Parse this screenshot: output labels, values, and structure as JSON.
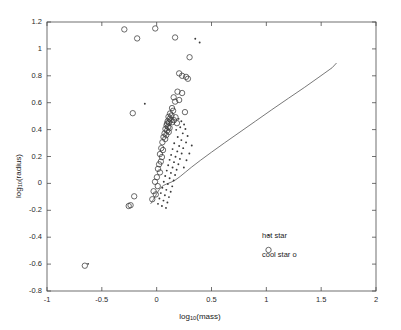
{
  "chart_data": {
    "type": "scatter",
    "title": "",
    "xlabel": "log10(mass)",
    "ylabel": "log10(radius)",
    "xlim": [
      -1,
      2
    ],
    "ylim": [
      -0.8,
      1.2
    ],
    "xticks": [
      "-1",
      "-0.5",
      "0",
      "0.5",
      "1",
      "1.5",
      "2"
    ],
    "xtickvals": [
      -1,
      -0.5,
      0,
      0.5,
      1,
      1.5,
      2
    ],
    "yticks": [
      "-0.8",
      "-0.6",
      "-0.4",
      "-0.2",
      "0",
      "0.2",
      "0.4",
      "0.6",
      "0.8",
      "1",
      "1.2"
    ],
    "ytickvals": [
      -0.8,
      -0.6,
      -0.4,
      -0.2,
      0,
      0.2,
      0.4,
      0.6,
      0.8,
      1.0,
      1.2
    ],
    "grid": false,
    "legend_position": "inside-lower-right",
    "marker_color": "#3a3a3a",
    "line_color": "#555555",
    "series": [
      {
        "name": "cool star",
        "marker": "o",
        "points": [
          [
            -0.655,
            -0.612
          ],
          [
            -0.255,
            -0.168
          ],
          [
            -0.238,
            -0.162
          ],
          [
            -0.205,
            -0.096
          ],
          [
            -0.218,
            0.522
          ],
          [
            -0.295,
            1.145
          ],
          [
            -0.178,
            1.078
          ],
          [
            -0.013,
            1.152
          ],
          [
            0.168,
            1.085
          ],
          [
            0.3,
            0.938
          ],
          [
            0.232,
            0.8
          ],
          [
            0.268,
            0.792
          ],
          [
            0.285,
            0.778
          ],
          [
            0.205,
            0.818
          ],
          [
            0.19,
            0.682
          ],
          [
            0.232,
            0.672
          ],
          [
            0.155,
            0.64
          ],
          [
            0.168,
            0.608
          ],
          [
            0.205,
            0.62
          ],
          [
            0.258,
            0.53
          ],
          [
            0.14,
            0.56
          ],
          [
            0.15,
            0.54
          ],
          [
            0.122,
            0.52
          ],
          [
            0.135,
            0.505
          ],
          [
            0.108,
            0.495
          ],
          [
            0.118,
            0.48
          ],
          [
            0.128,
            0.47
          ],
          [
            0.1,
            0.462
          ],
          [
            0.112,
            0.452
          ],
          [
            0.095,
            0.445
          ],
          [
            0.142,
            0.455
          ],
          [
            0.158,
            0.47
          ],
          [
            0.172,
            0.492
          ],
          [
            0.185,
            0.448
          ],
          [
            0.09,
            0.432
          ],
          [
            0.105,
            0.42
          ],
          [
            0.118,
            0.412
          ],
          [
            0.08,
            0.405
          ],
          [
            0.095,
            0.392
          ],
          [
            0.11,
            0.382
          ],
          [
            0.072,
            0.372
          ],
          [
            0.088,
            0.36
          ],
          [
            0.062,
            0.345
          ],
          [
            0.078,
            0.33
          ],
          [
            0.052,
            0.306
          ],
          [
            0.042,
            0.262
          ],
          [
            0.03,
            0.218
          ],
          [
            0.048,
            0.196
          ],
          [
            0.022,
            0.142
          ],
          [
            0.012,
            0.108
          ],
          [
            0.03,
            0.082
          ],
          [
            0.002,
            0.046
          ],
          [
            -0.015,
            0.012
          ],
          [
            0.01,
            -0.02
          ],
          [
            -0.028,
            -0.058
          ],
          [
            -0.008,
            -0.082
          ],
          [
            -0.04,
            -0.118
          ],
          [
            0.038,
            0.162
          ],
          [
            0.058,
            0.248
          ]
        ]
      },
      {
        "name": "hot star",
        "marker": ".",
        "points": [
          [
            -0.625,
            -0.598
          ],
          [
            -0.108,
            0.592
          ],
          [
            0.352,
            1.075
          ],
          [
            0.392,
            1.048
          ],
          [
            0.2,
            0.48
          ],
          [
            0.225,
            0.462
          ],
          [
            0.25,
            0.438
          ],
          [
            0.215,
            0.418
          ],
          [
            0.262,
            0.405
          ],
          [
            0.178,
            0.398
          ],
          [
            0.238,
            0.372
          ],
          [
            0.282,
            0.352
          ],
          [
            0.192,
            0.345
          ],
          [
            0.225,
            0.322
          ],
          [
            0.268,
            0.305
          ],
          [
            0.16,
            0.298
          ],
          [
            0.205,
            0.278
          ],
          [
            0.242,
            0.262
          ],
          [
            0.145,
            0.255
          ],
          [
            0.188,
            0.238
          ],
          [
            0.228,
            0.222
          ],
          [
            0.132,
            0.212
          ],
          [
            0.172,
            0.198
          ],
          [
            0.212,
            0.182
          ],
          [
            0.118,
            0.175
          ],
          [
            0.158,
            0.158
          ],
          [
            0.198,
            0.142
          ],
          [
            0.105,
            0.135
          ],
          [
            0.145,
            0.118
          ],
          [
            0.182,
            0.102
          ],
          [
            0.092,
            0.095
          ],
          [
            0.13,
            0.078
          ],
          [
            0.168,
            0.062
          ],
          [
            0.078,
            0.055
          ],
          [
            0.118,
            0.038
          ],
          [
            0.155,
            0.022
          ],
          [
            0.065,
            0.012
          ],
          [
            0.102,
            -0.005
          ],
          [
            0.142,
            -0.022
          ],
          [
            0.052,
            -0.032
          ],
          [
            0.088,
            -0.048
          ],
          [
            0.128,
            -0.062
          ],
          [
            0.038,
            -0.072
          ],
          [
            0.075,
            -0.088
          ],
          [
            0.112,
            -0.102
          ],
          [
            0.025,
            -0.112
          ],
          [
            0.062,
            -0.128
          ],
          [
            0.098,
            -0.142
          ],
          [
            0.012,
            -0.152
          ],
          [
            0.048,
            -0.168
          ],
          [
            0.085,
            -0.182
          ],
          [
            0.32,
            0.282
          ],
          [
            0.298,
            0.222
          ],
          [
            0.272,
            0.172
          ],
          [
            0.248,
            0.118
          ]
        ]
      }
    ],
    "model_curve": {
      "name": "theoretical mass-radius relation",
      "points": [
        [
          -0.055,
          -0.152
        ],
        [
          -0.045,
          -0.14
        ],
        [
          -0.03,
          -0.12
        ],
        [
          -0.012,
          -0.095
        ],
        [
          0.005,
          -0.07
        ],
        [
          0.022,
          -0.048
        ],
        [
          0.04,
          -0.03
        ],
        [
          0.06,
          -0.016
        ],
        [
          0.085,
          -0.006
        ],
        [
          0.11,
          0.002
        ],
        [
          0.14,
          0.012
        ],
        [
          0.175,
          0.028
        ],
        [
          0.215,
          0.052
        ],
        [
          0.26,
          0.082
        ],
        [
          0.32,
          0.122
        ],
        [
          0.4,
          0.172
        ],
        [
          0.5,
          0.232
        ],
        [
          0.62,
          0.302
        ],
        [
          0.76,
          0.382
        ],
        [
          0.9,
          0.462
        ],
        [
          1.05,
          0.548
        ],
        [
          1.2,
          0.632
        ],
        [
          1.35,
          0.715
        ],
        [
          1.48,
          0.79
        ],
        [
          1.6,
          0.86
        ],
        [
          1.64,
          0.895
        ]
      ]
    },
    "annotations": [
      {
        "id": "hot-star-legend",
        "text": "hot star",
        "marker": ".",
        "x": 1.02,
        "y": -0.385
      },
      {
        "id": "cool-star-legend",
        "text": "cool star o",
        "marker": "o",
        "x": 1.02,
        "y": -0.495
      }
    ]
  },
  "axis": {
    "xlabel_main": "log",
    "xlabel_sub": "10",
    "xlabel_tail": "(mass)",
    "ylabel_main": "log",
    "ylabel_sub": "10",
    "ylabel_tail": "(radius)"
  },
  "legend": {
    "hot": "hot star",
    "cool": "cool star o"
  }
}
